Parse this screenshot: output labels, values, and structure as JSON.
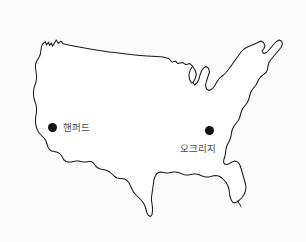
{
  "figure": {
    "name": "us-map-with-site-markers",
    "background_color": "#fbfbfb",
    "outline_color": "#1a1a1a",
    "fill_color": "#ffffff",
    "width": 306,
    "height": 242
  },
  "markers": [
    {
      "id": "hanford",
      "label": "핸퍼드",
      "dot_color": "#121212",
      "label_color": "#4a4a4a",
      "x": 52,
      "y": 127
    },
    {
      "id": "oakridge",
      "label": "오크리지",
      "dot_color": "#121212",
      "label_color": "#4a4a4a",
      "x": 209,
      "y": 130
    }
  ]
}
